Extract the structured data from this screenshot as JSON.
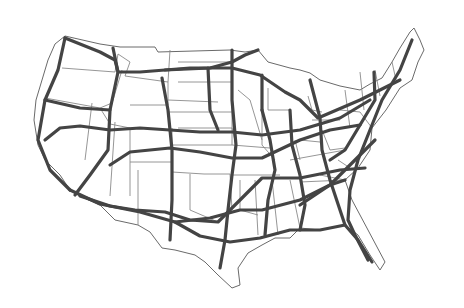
{
  "map": {
    "title": "",
    "description": "Contiguous United States with state borders and Interstate highway network",
    "colors": {
      "background": "#ffffff",
      "state_border": "#8a8a8a",
      "highway": "#444444"
    },
    "outline": "M65,36 L100,44 L120,47 L155,47 L158,52 L230,50 L245,52 L258,50 L268,62 L290,68 L300,70 L310,73 L320,80 L340,86 L360,90 L370,84 L382,78 L392,62 L400,48 L410,32 L414,28 L420,40 L424,50 L418,62 L412,80 L400,88 L386,110 L372,128 L370,150 L358,168 L345,180 L352,200 L368,230 L385,262 L380,270 L370,255 L358,235 L345,225 L320,230 L300,228 L290,238 L275,238 L262,245 L248,253 L238,268 L240,285 L232,288 L218,275 L205,262 L195,255 L175,250 L162,248 L150,232 L138,225 L115,220 L100,205 L80,196 L70,190 L60,175 L45,160 L38,145 L34,120 L36,100 L42,80 L48,60 L55,44 Z",
    "state_borders": [
      "M62,68 L115,72 L118,54",
      "M45,98 L100,108 L112,103",
      "M92,103 L85,160",
      "M100,108 L110,124 L130,128",
      "M110,110 L122,70",
      "M115,122 L110,196",
      "M130,128 L130,196",
      "M118,54 L130,62 L125,76 L168,82 L170,50",
      "M168,82 L168,105 L130,105",
      "M168,100 L218,102",
      "M172,128 L172,172 L204,174",
      "M130,162 L172,162",
      "M138,170 L138,225",
      "M178,62 L230,62",
      "M178,82 L232,82",
      "M168,112 L232,112",
      "M178,128 L232,128 L236,145",
      "M172,145 L232,145",
      "M190,174 L190,210 L218,222",
      "M204,174 L230,174 L232,210",
      "M232,62 L232,145",
      "M232,145 L270,148",
      "M238,90 L250,100 L256,120 L262,140",
      "M262,110 L262,145 L275,160",
      "M232,175 L280,175",
      "M240,180 L240,210 L258,215",
      "M255,180 L258,235",
      "M272,180 L278,235",
      "M290,180 L300,228",
      "M290,160 L345,150",
      "M295,140 L300,160",
      "M312,120 L340,120",
      "M322,130 L330,150 L345,148",
      "M300,140 L320,142",
      "M340,110 L360,112 L372,128",
      "M345,90 L350,128",
      "M360,72 L364,110",
      "M375,70 L380,96",
      "M392,62 L396,80",
      "M320,175 L345,180",
      "M338,160 L350,168",
      "M300,182 L345,180",
      "M268,88 L268,110 L290,110",
      "M290,110 L292,140",
      "M308,96 L312,110 L322,112"
    ],
    "highways": [
      {
        "name": "I-5",
        "path": "M65,38 L58,70 L45,100 L38,140 L50,170 L70,190"
      },
      {
        "name": "I-90 west",
        "path": "M65,38 L100,52 L115,60 L118,72 L140,72 L165,70 L190,68 L232,68 L260,75 L285,92 L300,100 L318,118 L360,100 L400,80"
      },
      {
        "name": "I-94",
        "path": "M165,70 L210,68 L232,62 L245,55 L258,50"
      },
      {
        "name": "I-80",
        "path": "M45,140 L60,128 L80,126 L110,130 L140,128 L170,130 L200,132 L232,132 L262,135 L300,130 L340,118 L370,100"
      },
      {
        "name": "I-70",
        "path": "M110,165 L130,152 L170,148 L200,152 L232,158 L262,158 L300,140 L330,130 L360,125"
      },
      {
        "name": "I-40",
        "path": "M80,196 L110,206 L135,210 L165,212 L190,220 L218,222 L240,200 L262,178 L300,178 L340,170 L365,168"
      },
      {
        "name": "I-10",
        "path": "M70,190 L100,204 L140,212 L175,222 L200,236 L230,242 L260,238 L290,230 L320,230 L345,225"
      },
      {
        "name": "I-15",
        "path": "M113,48 L118,72 L110,110 L108,150 L90,175 L75,195"
      },
      {
        "name": "I-25",
        "path": "M162,78 L168,110 L172,150 L172,200 L170,240"
      },
      {
        "name": "I-35",
        "path": "M232,50 L232,100 L236,145 L232,175 L228,210 L225,240 L220,268"
      },
      {
        "name": "I-55",
        "path": "M262,110 L270,140 L275,170 L268,200 L265,235"
      },
      {
        "name": "I-65",
        "path": "M290,110 L292,145 L300,175 L305,205 L300,230"
      },
      {
        "name": "I-75",
        "path": "M310,80 L320,118 L322,150 L330,180 L345,225 L358,240 L372,262"
      },
      {
        "name": "I-95",
        "path": "M412,40 L400,70 L382,100 L370,130 L358,160 L350,190 L348,220 L355,235 L368,260"
      },
      {
        "name": "I-81",
        "path": "M374,72 L375,100 L360,125 L345,150 L330,160"
      },
      {
        "name": "I-84",
        "path": "M45,100 L80,108 L110,110"
      },
      {
        "name": "I-29",
        "path": "M208,68 L210,110 L218,130"
      },
      {
        "name": "I-20",
        "path": "M175,222 L210,218 L240,210 L262,210 L300,200 L330,185 L345,180"
      },
      {
        "name": "I-85",
        "path": "M300,205 L330,185 L355,160 L375,140"
      },
      {
        "name": "I-39",
        "path": "M262,75 L262,110"
      }
    ]
  }
}
